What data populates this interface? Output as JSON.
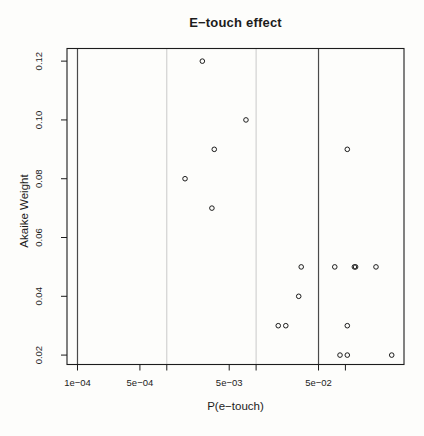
{
  "figure": {
    "title": "E−touch effect",
    "xlabel": "P(e−touch)",
    "ylabel": "Akaike Weight"
  },
  "colors": {
    "background": "#fdfdfb",
    "axis": "#1c1c1c",
    "marker": "#1c1c1c",
    "vline_dark": "#4a4a4a",
    "vline_light": "#c9c9c9"
  },
  "chart_data": {
    "type": "scatter",
    "title": "E−touch effect",
    "xlabel": "P(e−touch)",
    "ylabel": "Akaike Weight",
    "x_scale": "log10",
    "xlim": [
      7.63e-05,
      0.453
    ],
    "ylim": [
      0.0168,
      0.1243
    ],
    "grid": "off",
    "legend": "none",
    "marker": "open-circle",
    "x_ticks": [
      {
        "value": 0.0001,
        "label": "1e−04"
      },
      {
        "value": 0.0005,
        "label": "5e−04"
      },
      {
        "value": 0.001,
        "label": ""
      },
      {
        "value": 0.005,
        "label": "5e−03"
      },
      {
        "value": 0.01,
        "label": ""
      },
      {
        "value": 0.05,
        "label": "5e−02"
      },
      {
        "value": 0.1,
        "label": ""
      }
    ],
    "y_ticks": [
      {
        "value": 0.02,
        "label": "0.02"
      },
      {
        "value": 0.04,
        "label": "0.04"
      },
      {
        "value": 0.06,
        "label": "0.06"
      },
      {
        "value": 0.08,
        "label": "0.08"
      },
      {
        "value": 0.1,
        "label": "0.10"
      },
      {
        "value": 0.12,
        "label": "0.12"
      }
    ],
    "vlines": [
      {
        "x": 0.0001,
        "style": "dark"
      },
      {
        "x": 0.001,
        "style": "light"
      },
      {
        "x": 0.01,
        "style": "light"
      },
      {
        "x": 0.05,
        "style": "dark"
      }
    ],
    "points": [
      {
        "x": 0.0025,
        "y": 0.12
      },
      {
        "x": 0.0077,
        "y": 0.1
      },
      {
        "x": 0.0034,
        "y": 0.09
      },
      {
        "x": 0.105,
        "y": 0.09
      },
      {
        "x": 0.0016,
        "y": 0.08
      },
      {
        "x": 0.0032,
        "y": 0.07
      },
      {
        "x": 0.032,
        "y": 0.05
      },
      {
        "x": 0.076,
        "y": 0.05
      },
      {
        "x": 0.126,
        "y": 0.05
      },
      {
        "x": 0.13,
        "y": 0.05
      },
      {
        "x": 0.22,
        "y": 0.05
      },
      {
        "x": 0.03,
        "y": 0.04
      },
      {
        "x": 0.0177,
        "y": 0.03
      },
      {
        "x": 0.0215,
        "y": 0.03
      },
      {
        "x": 0.105,
        "y": 0.03
      },
      {
        "x": 0.087,
        "y": 0.02
      },
      {
        "x": 0.105,
        "y": 0.02
      },
      {
        "x": 0.33,
        "y": 0.02
      }
    ]
  }
}
